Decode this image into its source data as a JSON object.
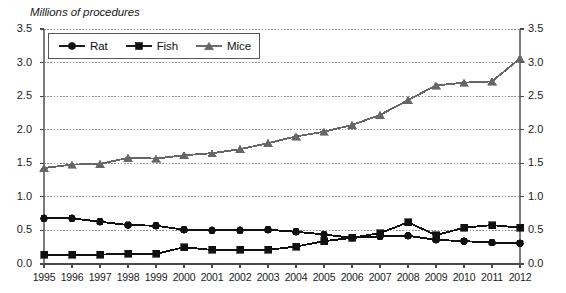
{
  "title_partial": "",
  "axis": {
    "ylabel": "Millions of procedures",
    "y_ticks": [
      "3.5",
      "3.0",
      "2.5",
      "2.0",
      "1.5",
      "1.0",
      "0.5",
      "0.0"
    ],
    "y_ticks_right": [
      "3.5",
      "3.0",
      "2.5",
      "2.0",
      "1.5",
      "1.0",
      "0.5",
      "0.0"
    ],
    "x_ticks": [
      "1995",
      "1996",
      "1997",
      "1998",
      "1999",
      "2000",
      "2001",
      "2002",
      "2003",
      "2004",
      "2005",
      "2006",
      "2007",
      "2008",
      "2009",
      "2010",
      "2011",
      "2012"
    ]
  },
  "legend": {
    "items": [
      {
        "label": "Rat",
        "marker": "circle",
        "color": "#111111"
      },
      {
        "label": "Fish",
        "marker": "square",
        "color": "#111111"
      },
      {
        "label": "Mice",
        "marker": "triangle",
        "color": "#666666"
      }
    ]
  },
  "chart_data": {
    "type": "line",
    "title": "Millions of procedures",
    "xlabel": "",
    "ylabel": "Millions of procedures",
    "ylim": [
      0,
      3.5
    ],
    "ytick_step": 0.5,
    "grid": true,
    "grid_style": "dotted-horizontal",
    "legend_position": "top-left-inside",
    "dual_y_axis": true,
    "x": [
      "1995",
      "1996",
      "1997",
      "1998",
      "1999",
      "2000",
      "2001",
      "2002",
      "2003",
      "2004",
      "2005",
      "2006",
      "2007",
      "2008",
      "2009",
      "2010",
      "2011",
      "2012"
    ],
    "series": [
      {
        "name": "Rat",
        "marker": "circle",
        "color": "#111111",
        "values": [
          0.68,
          0.68,
          0.63,
          0.58,
          0.57,
          0.51,
          0.5,
          0.5,
          0.51,
          0.48,
          0.44,
          0.39,
          0.41,
          0.42,
          0.36,
          0.34,
          0.32,
          0.31
        ]
      },
      {
        "name": "Fish",
        "marker": "square",
        "color": "#111111",
        "values": [
          0.14,
          0.14,
          0.14,
          0.15,
          0.15,
          0.25,
          0.21,
          0.21,
          0.21,
          0.26,
          0.34,
          0.39,
          0.46,
          0.62,
          0.43,
          0.54,
          0.58,
          0.54
        ]
      },
      {
        "name": "Mice",
        "marker": "triangle",
        "color": "#666666",
        "values": [
          1.43,
          1.48,
          1.49,
          1.58,
          1.57,
          1.62,
          1.65,
          1.71,
          1.8,
          1.9,
          1.97,
          2.07,
          2.22,
          2.44,
          2.66,
          2.7,
          2.72,
          3.06
        ]
      }
    ]
  },
  "plot_geometry": {
    "left_px": 44,
    "right_px": 520,
    "top_px": 29,
    "bottom_px": 264
  }
}
